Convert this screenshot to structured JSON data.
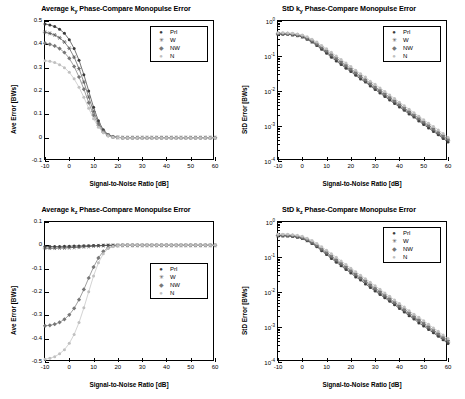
{
  "figure": {
    "background": "#ffffff",
    "series_colors": {
      "Prl": "#3a3a3a",
      "W": "#555555",
      "NW": "#777777",
      "N": "#c0c0c0"
    }
  },
  "panels": [
    {
      "id": "top-left",
      "title": "Average k_y Phase-Compare Monopulse Error",
      "legend_position": "top-right",
      "chart_data": {
        "type": "line",
        "title": "Average k_y Phase-Compare Monopulse Error",
        "xlabel": "Signal-to-Noise Ratio [dB]",
        "ylabel": "Ave Error [BWs]",
        "xlim": [
          -10,
          60
        ],
        "ylim": [
          -0.1,
          0.5
        ],
        "xticks": [
          -10,
          0,
          10,
          20,
          30,
          40,
          50,
          60
        ],
        "yticks": [
          -0.1,
          0,
          0.1,
          0.2,
          0.3,
          0.4,
          0.5
        ],
        "grid": false,
        "legend": [
          "Prl",
          "W",
          "NW",
          "N"
        ],
        "x": [
          -10,
          -8,
          -6,
          -4,
          -2,
          0,
          2,
          4,
          6,
          8,
          10,
          12,
          14,
          16,
          18,
          20,
          22,
          24,
          26,
          28,
          30,
          32,
          34,
          36,
          38,
          40,
          42,
          44,
          46,
          48,
          50,
          52,
          54,
          56,
          58,
          60
        ],
        "series": [
          {
            "name": "Prl",
            "marker": "dot",
            "values": [
              0.487,
              0.483,
              0.476,
              0.465,
              0.447,
              0.42,
              0.382,
              0.332,
              0.27,
              0.2,
              0.13,
              0.072,
              0.034,
              0.013,
              0.004,
              0.001,
              0.0,
              0.0,
              0.0,
              0.0,
              0.0,
              0.0,
              0.0,
              0.0,
              0.0,
              0.0,
              0.0,
              0.0,
              0.0,
              0.0,
              0.0,
              0.0,
              0.0,
              0.0,
              0.0,
              0.0
            ]
          },
          {
            "name": "W",
            "marker": "star",
            "values": [
              0.452,
              0.447,
              0.44,
              0.428,
              0.41,
              0.383,
              0.345,
              0.296,
              0.238,
              0.174,
              0.112,
              0.062,
              0.029,
              0.011,
              0.003,
              0.001,
              0.0,
              0.0,
              0.0,
              0.0,
              0.0,
              0.0,
              0.0,
              0.0,
              0.0,
              0.0,
              0.0,
              0.0,
              0.0,
              0.0,
              0.0,
              0.0,
              0.0,
              0.0,
              0.0,
              0.0
            ]
          },
          {
            "name": "NW",
            "marker": "diamond",
            "values": [
              0.405,
              0.4,
              0.393,
              0.382,
              0.365,
              0.34,
              0.305,
              0.26,
              0.208,
              0.15,
              0.096,
              0.053,
              0.024,
              0.009,
              0.003,
              0.001,
              0.0,
              0.0,
              0.0,
              0.0,
              0.0,
              0.0,
              0.0,
              0.0,
              0.0,
              0.0,
              0.0,
              0.0,
              0.0,
              0.0,
              0.0,
              0.0,
              0.0,
              0.0,
              0.0,
              0.0
            ]
          },
          {
            "name": "N",
            "marker": "dot-light",
            "values": [
              0.33,
              0.327,
              0.322,
              0.313,
              0.3,
              0.28,
              0.252,
              0.216,
              0.173,
              0.126,
              0.081,
              0.045,
              0.021,
              0.008,
              0.002,
              0.001,
              0.0,
              0.0,
              0.0,
              0.0,
              0.0,
              0.0,
              0.0,
              0.0,
              0.0,
              0.0,
              0.0,
              0.0,
              0.0,
              0.0,
              0.0,
              0.0,
              0.0,
              0.0,
              0.0,
              0.0
            ]
          }
        ]
      }
    },
    {
      "id": "top-right",
      "title": "StD k_y Phase-Compare Monopulse Error",
      "legend_position": "top-right",
      "chart_data": {
        "type": "line",
        "title": "StD k_y Phase-Compare Monopulse Error",
        "xlabel": "Signal-to-Noise Ratio [dB]",
        "ylabel": "StD Error [BWs]",
        "xlim": [
          -10,
          60
        ],
        "ylim": [
          0.0001,
          1
        ],
        "yscale": "log",
        "xticks": [
          -10,
          0,
          10,
          20,
          30,
          40,
          50,
          60
        ],
        "yticks": [
          0.0001,
          0.001,
          0.01,
          0.1,
          1
        ],
        "ytick_labels": [
          "10-4",
          "10-3",
          "10-2",
          "10-1",
          "100"
        ],
        "grid": false,
        "legend": [
          "Prl",
          "W",
          "NW",
          "N"
        ],
        "x": [
          -10,
          -8,
          -6,
          -4,
          -2,
          0,
          2,
          4,
          6,
          8,
          10,
          12,
          14,
          16,
          18,
          20,
          22,
          24,
          26,
          28,
          30,
          32,
          34,
          36,
          38,
          40,
          42,
          44,
          46,
          48,
          50,
          52,
          54,
          56,
          58,
          60
        ],
        "series": [
          {
            "name": "Prl",
            "marker": "dot",
            "values": [
              0.42,
              0.42,
              0.415,
              0.4,
              0.38,
              0.35,
              0.3,
              0.25,
              0.2,
              0.155,
              0.12,
              0.092,
              0.072,
              0.057,
              0.045,
              0.036,
              0.028,
              0.022,
              0.018,
              0.014,
              0.011,
              0.0088,
              0.007,
              0.0055,
              0.0044,
              0.0035,
              0.0028,
              0.0022,
              0.0018,
              0.0014,
              0.0011,
              0.00088,
              0.0007,
              0.00056,
              0.00044,
              0.00035
            ]
          },
          {
            "name": "W",
            "marker": "star",
            "values": [
              0.43,
              0.43,
              0.425,
              0.41,
              0.39,
              0.36,
              0.31,
              0.26,
              0.21,
              0.165,
              0.13,
              0.1,
              0.079,
              0.062,
              0.049,
              0.039,
              0.031,
              0.024,
              0.019,
              0.015,
              0.012,
              0.0096,
              0.0076,
              0.006,
              0.0048,
              0.0038,
              0.003,
              0.0024,
              0.0019,
              0.0015,
              0.0012,
              0.00096,
              0.00076,
              0.0006,
              0.00048,
              0.00038
            ]
          },
          {
            "name": "NW",
            "marker": "diamond",
            "values": [
              0.44,
              0.44,
              0.435,
              0.42,
              0.4,
              0.37,
              0.325,
              0.275,
              0.225,
              0.18,
              0.142,
              0.111,
              0.088,
              0.069,
              0.055,
              0.043,
              0.034,
              0.027,
              0.021,
              0.017,
              0.013,
              0.0106,
              0.0084,
              0.0066,
              0.0053,
              0.0042,
              0.0033,
              0.0026,
              0.0021,
              0.0017,
              0.0013,
              0.00106,
              0.00084,
              0.00066,
              0.00053,
              0.00042
            ]
          },
          {
            "name": "N",
            "marker": "dot-light",
            "values": [
              0.46,
              0.46,
              0.455,
              0.445,
              0.425,
              0.4,
              0.355,
              0.3,
              0.25,
              0.2,
              0.16,
              0.127,
              0.1,
              0.079,
              0.063,
              0.05,
              0.039,
              0.031,
              0.025,
              0.019,
              0.0155,
              0.0122,
              0.0097,
              0.0077,
              0.0061,
              0.0048,
              0.0038,
              0.003,
              0.0024,
              0.0019,
              0.0015,
              0.0012,
              0.00097,
              0.00077,
              0.00061,
              0.00048
            ]
          }
        ]
      }
    },
    {
      "id": "bottom-left",
      "title": "Average k_z Phase-Compare Monopulse Error",
      "legend_position": "middle-right",
      "chart_data": {
        "type": "line",
        "title": "Average k_z Phase-Compare Monopulse Error",
        "xlabel": "Signal-to-Noise Ratio [dB]",
        "ylabel": "Ave Error [BWs]",
        "xlim": [
          -10,
          60
        ],
        "ylim": [
          -0.5,
          0.1
        ],
        "xticks": [
          -10,
          0,
          10,
          20,
          30,
          40,
          50,
          60
        ],
        "yticks": [
          -0.5,
          -0.4,
          -0.3,
          -0.2,
          -0.1,
          0,
          0.1
        ],
        "grid": false,
        "legend": [
          "Prl",
          "W",
          "NW",
          "N"
        ],
        "x": [
          -10,
          -8,
          -6,
          -4,
          -2,
          0,
          2,
          4,
          6,
          8,
          10,
          12,
          14,
          16,
          18,
          20,
          22,
          24,
          26,
          28,
          30,
          32,
          34,
          36,
          38,
          40,
          42,
          44,
          46,
          48,
          50,
          52,
          54,
          56,
          58,
          60
        ],
        "series": [
          {
            "name": "Prl",
            "marker": "dot",
            "values": [
              -0.005,
              -0.005,
              -0.005,
              -0.005,
              -0.004,
              -0.004,
              -0.003,
              -0.003,
              -0.002,
              -0.002,
              -0.001,
              -0.001,
              0.0,
              0.0,
              0.0,
              0.0,
              0.0,
              0.0,
              0.0,
              0.0,
              0.0,
              0.0,
              0.0,
              0.0,
              0.0,
              0.0,
              0.0,
              0.0,
              0.0,
              0.0,
              0.0,
              0.0,
              0.0,
              0.0,
              0.0,
              0.0
            ]
          },
          {
            "name": "W",
            "marker": "star",
            "values": [
              -0.012,
              -0.012,
              -0.012,
              -0.011,
              -0.011,
              -0.01,
              -0.009,
              -0.008,
              -0.006,
              -0.005,
              -0.003,
              -0.002,
              -0.001,
              0.0,
              0.0,
              0.0,
              0.0,
              0.0,
              0.0,
              0.0,
              0.0,
              0.0,
              0.0,
              0.0,
              0.0,
              0.0,
              0.0,
              0.0,
              0.0,
              0.0,
              0.0,
              0.0,
              0.0,
              0.0,
              0.0,
              0.0
            ]
          },
          {
            "name": "NW",
            "marker": "diamond",
            "values": [
              -0.345,
              -0.343,
              -0.338,
              -0.33,
              -0.317,
              -0.298,
              -0.27,
              -0.233,
              -0.189,
              -0.14,
              -0.093,
              -0.054,
              -0.026,
              -0.011,
              -0.004,
              -0.001,
              0.0,
              0.0,
              0.0,
              0.0,
              0.0,
              0.0,
              0.0,
              0.0,
              0.0,
              0.0,
              0.0,
              0.0,
              0.0,
              0.0,
              0.0,
              0.0,
              0.0,
              0.0,
              0.0,
              0.0
            ]
          },
          {
            "name": "N",
            "marker": "dot-light",
            "values": [
              -0.488,
              -0.484,
              -0.477,
              -0.465,
              -0.447,
              -0.42,
              -0.382,
              -0.331,
              -0.268,
              -0.199,
              -0.131,
              -0.075,
              -0.036,
              -0.014,
              -0.005,
              -0.001,
              0.0,
              0.0,
              0.0,
              0.0,
              0.0,
              0.0,
              0.0,
              0.0,
              0.0,
              0.0,
              0.0,
              0.0,
              0.0,
              0.0,
              0.0,
              0.0,
              0.0,
              0.0,
              0.0,
              0.0
            ]
          }
        ]
      }
    },
    {
      "id": "bottom-right",
      "title": "StD k_z Phase-Compare Monopulse Error",
      "legend_position": "top-right",
      "chart_data": {
        "type": "line",
        "title": "StD k_z Phase-Compare Monopulse Error",
        "xlabel": "Signal-to-Noise Ratio [dB]",
        "ylabel": "StD Error [BWs]",
        "xlim": [
          -10,
          60
        ],
        "ylim": [
          0.0001,
          1
        ],
        "yscale": "log",
        "xticks": [
          -10,
          0,
          10,
          20,
          30,
          40,
          50,
          60
        ],
        "yticks": [
          0.0001,
          0.001,
          0.01,
          0.1,
          1
        ],
        "ytick_labels": [
          "10-4",
          "10-3",
          "10-2",
          "10-1",
          "100"
        ],
        "grid": false,
        "legend": [
          "Prl",
          "W",
          "NW",
          "N"
        ],
        "x": [
          -10,
          -8,
          -6,
          -4,
          -2,
          0,
          2,
          4,
          6,
          8,
          10,
          12,
          14,
          16,
          18,
          20,
          22,
          24,
          26,
          28,
          30,
          32,
          34,
          36,
          38,
          40,
          42,
          44,
          46,
          48,
          50,
          52,
          54,
          56,
          58,
          60
        ],
        "series": [
          {
            "name": "Prl",
            "marker": "dot",
            "values": [
              0.4,
              0.4,
              0.395,
              0.385,
              0.365,
              0.335,
              0.29,
              0.245,
              0.195,
              0.152,
              0.118,
              0.091,
              0.071,
              0.056,
              0.044,
              0.035,
              0.027,
              0.022,
              0.017,
              0.0135,
              0.0107,
              0.0085,
              0.0068,
              0.0054,
              0.0043,
              0.0034,
              0.0027,
              0.0021,
              0.0017,
              0.0013,
              0.00107,
              0.00085,
              0.00068,
              0.00054,
              0.00043,
              0.00034
            ]
          },
          {
            "name": "W",
            "marker": "star",
            "values": [
              0.41,
              0.41,
              0.405,
              0.395,
              0.375,
              0.345,
              0.3,
              0.255,
              0.205,
              0.16,
              0.126,
              0.098,
              0.077,
              0.061,
              0.048,
              0.038,
              0.03,
              0.024,
              0.019,
              0.0147,
              0.0117,
              0.0093,
              0.0074,
              0.0059,
              0.0047,
              0.0037,
              0.0029,
              0.0023,
              0.0018,
              0.0015,
              0.00117,
              0.00093,
              0.00074,
              0.00059,
              0.00047,
              0.00037
            ]
          },
          {
            "name": "NW",
            "marker": "diamond",
            "values": [
              0.425,
              0.425,
              0.42,
              0.41,
              0.39,
              0.36,
              0.315,
              0.268,
              0.218,
              0.172,
              0.136,
              0.107,
              0.084,
              0.067,
              0.053,
              0.042,
              0.033,
              0.026,
              0.021,
              0.0163,
              0.0129,
              0.0103,
              0.0082,
              0.0065,
              0.0051,
              0.0041,
              0.0032,
              0.0026,
              0.002,
              0.0016,
              0.0013,
              0.00103,
              0.00082,
              0.00065,
              0.00051,
              0.00041
            ]
          },
          {
            "name": "N",
            "marker": "dot-light",
            "values": [
              0.45,
              0.45,
              0.445,
              0.435,
              0.415,
              0.39,
              0.345,
              0.295,
              0.245,
              0.195,
              0.156,
              0.124,
              0.098,
              0.077,
              0.061,
              0.048,
              0.038,
              0.03,
              0.024,
              0.019,
              0.015,
              0.0119,
              0.0094,
              0.0075,
              0.0059,
              0.0047,
              0.0037,
              0.0029,
              0.0023,
              0.0019,
              0.0015,
              0.00119,
              0.00094,
              0.00075,
              0.00059,
              0.00047
            ]
          }
        ]
      }
    }
  ]
}
